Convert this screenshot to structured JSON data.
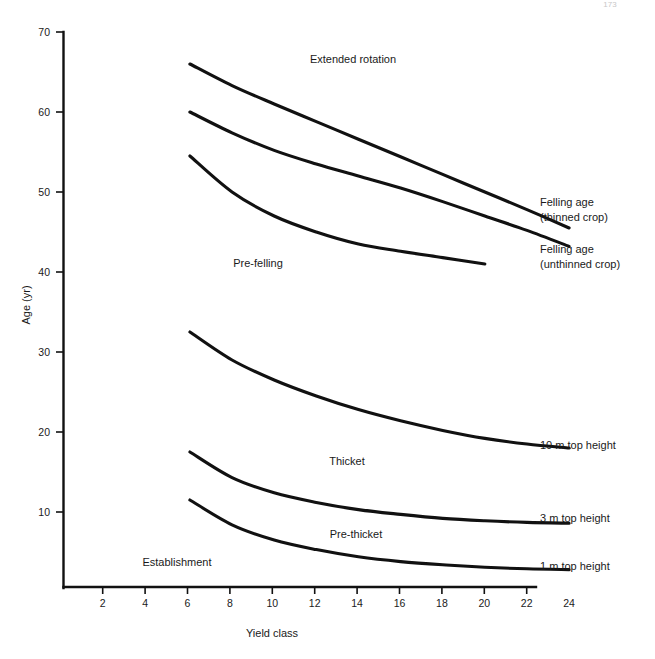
{
  "figure": {
    "page_number": "173",
    "background_color": "#ffffff",
    "line_color": "#111111"
  },
  "chart_data": {
    "type": "line",
    "title": "",
    "xlabel": "Yield class",
    "ylabel": "Age (yr)",
    "xlim": [
      0,
      25
    ],
    "ylim": [
      0,
      70
    ],
    "grid": false,
    "legend_position": "right-inline",
    "x_ticks": [
      2,
      4,
      6,
      8,
      10,
      12,
      14,
      16,
      18,
      20,
      22,
      24
    ],
    "y_ticks": [
      10,
      20,
      30,
      40,
      50,
      60,
      70
    ],
    "series": [
      {
        "name": "Felling age (thinned crop)",
        "label_position": "right",
        "x": [
          6,
          8,
          10,
          12,
          14,
          16,
          18,
          20,
          22,
          24
        ],
        "values": [
          66.0,
          63.3,
          61.0,
          58.8,
          56.6,
          54.4,
          52.2,
          50.0,
          47.8,
          45.5
        ]
      },
      {
        "name": "Felling age (unthinned crop)",
        "label_position": "right",
        "x": [
          6,
          8,
          10,
          12,
          14,
          16,
          18,
          20,
          22,
          24
        ],
        "values": [
          60.0,
          57.4,
          55.2,
          53.5,
          52.0,
          50.5,
          48.8,
          47.0,
          45.2,
          43.2
        ]
      },
      {
        "name": "Pre-felling boundary",
        "label_position": "none",
        "x": [
          6,
          8,
          10,
          12,
          14,
          16,
          18,
          20
        ],
        "values": [
          54.5,
          50.0,
          47.0,
          45.0,
          43.5,
          42.6,
          41.8,
          41.0
        ]
      },
      {
        "name": "10 m top height",
        "label_position": "right",
        "x": [
          6,
          8,
          10,
          12,
          14,
          16,
          18,
          20,
          22,
          24
        ],
        "values": [
          32.5,
          29.0,
          26.5,
          24.5,
          22.8,
          21.4,
          20.2,
          19.2,
          18.5,
          18.0
        ]
      },
      {
        "name": "3 m top height",
        "label_position": "right",
        "x": [
          6,
          8,
          10,
          12,
          14,
          16,
          18,
          20,
          22,
          24
        ],
        "values": [
          17.5,
          14.3,
          12.4,
          11.2,
          10.3,
          9.7,
          9.2,
          8.9,
          8.7,
          8.6
        ]
      },
      {
        "name": "1 m top height",
        "label_position": "right",
        "x": [
          6,
          8,
          10,
          12,
          14,
          16,
          18,
          20,
          22,
          24
        ],
        "values": [
          11.5,
          8.4,
          6.5,
          5.3,
          4.4,
          3.8,
          3.4,
          3.1,
          2.9,
          2.8
        ]
      }
    ],
    "zone_annotations": [
      {
        "text": "Extended rotation",
        "x": 13.8,
        "y": 65.2
      },
      {
        "text": "Pre-felling",
        "x": 9.5,
        "y": 39.8
      },
      {
        "text": "Thicket",
        "x": 12.8,
        "y": 16.3
      },
      {
        "text": "Pre-thicket",
        "x": 12.5,
        "y": 6.8
      },
      {
        "text": "Establishment",
        "x": 8.3,
        "y": 3.1
      }
    ],
    "right_labels": [
      {
        "text": "Felling age",
        "sub": "(thinned crop)"
      },
      {
        "text": "Felling age",
        "sub": "(unthinned crop)"
      },
      {
        "text": "10 m top height",
        "sub": ""
      },
      {
        "text": "3 m top height",
        "sub": ""
      },
      {
        "text": "1 m top height",
        "sub": ""
      }
    ]
  }
}
